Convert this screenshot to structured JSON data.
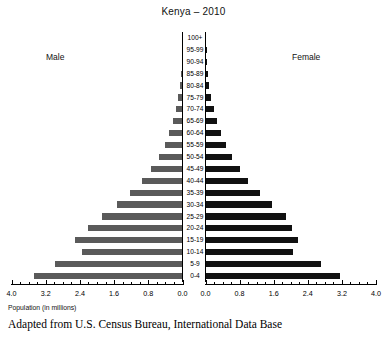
{
  "chart_title": "Kenya – 2010",
  "male_label": "Male",
  "female_label": "Female",
  "axis_caption": "Population (in millions)",
  "source_note": "Adapted from U.S. Census Bureau, International Data Base",
  "colors": {
    "male_bar": "#5a5a5a",
    "female_bar": "#111111",
    "axis": "#000000",
    "background": "#ffffff"
  },
  "left_axis_ticks": [
    "4.0",
    "3.2",
    "2.4",
    "1.6",
    "0.8",
    "0.0"
  ],
  "right_axis_ticks": [
    "0.0",
    "0.8",
    "1.6",
    "2.4",
    "3.2",
    "4.0"
  ],
  "chart_data": {
    "type": "bar",
    "subtype": "population-pyramid",
    "title": "Kenya – 2010",
    "xlabel": "Population (in millions)",
    "ylabel": "",
    "xlim": [
      0,
      4.0
    ],
    "xtick_step": 0.8,
    "xminor_step": 0.2,
    "grid": false,
    "legend": "side-labels",
    "categories": [
      "100+",
      "95-99",
      "90-94",
      "85-89",
      "80-84",
      "75-79",
      "70-74",
      "65-69",
      "60-64",
      "55-59",
      "50-54",
      "45-49",
      "40-44",
      "35-39",
      "30-34",
      "25-29",
      "20-24",
      "15-19",
      "10-14",
      "5-9",
      "0-4"
    ],
    "series": [
      {
        "name": "Male",
        "direction": "left",
        "color": "#5a5a5a",
        "values": [
          0.0,
          0.01,
          0.02,
          0.04,
          0.07,
          0.11,
          0.16,
          0.23,
          0.31,
          0.42,
          0.56,
          0.73,
          0.95,
          1.22,
          1.53,
          1.88,
          2.22,
          2.52,
          2.34,
          2.99,
          3.47
        ]
      },
      {
        "name": "Female",
        "direction": "right",
        "color": "#111111",
        "values": [
          0.0,
          0.01,
          0.02,
          0.05,
          0.09,
          0.14,
          0.2,
          0.28,
          0.37,
          0.48,
          0.62,
          0.8,
          1.0,
          1.28,
          1.55,
          1.88,
          2.02,
          2.17,
          2.05,
          2.72,
          3.15
        ]
      }
    ]
  }
}
